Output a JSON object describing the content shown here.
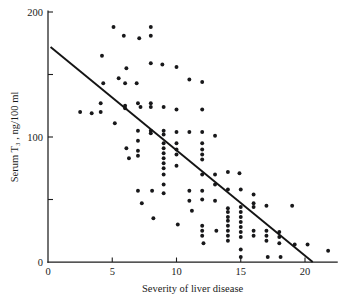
{
  "chart_data": {
    "type": "scatter",
    "title": "",
    "xlabel": "Severity of liver disease",
    "ylabel": "Serum T3 , ng/100 ml",
    "ylabel_display": "Serum T₃ , ng/100 ml",
    "xlim": [
      0,
      22.5
    ],
    "ylim": [
      0,
      205
    ],
    "xticks": [
      0,
      5,
      10,
      15,
      20
    ],
    "xtick_labels": [
      "0",
      "5",
      "10",
      "15",
      "20"
    ],
    "yticks": [
      0,
      50,
      100,
      150,
      200
    ],
    "ytick_labels": [
      "0",
      "",
      "100",
      "",
      "200"
    ],
    "ytick_labeled": [
      0,
      100,
      200
    ],
    "grid": false,
    "legend": null,
    "marker": "filled-circle",
    "marker_color": "#18181a",
    "line_color": "#141414",
    "fit_line": {
      "type": "linear-regression",
      "x_start": 0.2,
      "y_start": 172,
      "x_end": 20.6,
      "y_end": 0,
      "slope": -8.43,
      "intercept": 173.7
    },
    "points": [
      [
        2.5,
        120
      ],
      [
        3.4,
        119
      ],
      [
        4.1,
        127
      ],
      [
        4.1,
        120
      ],
      [
        4.2,
        165
      ],
      [
        4.3,
        143
      ],
      [
        5.1,
        188
      ],
      [
        5.2,
        111
      ],
      [
        5.5,
        147
      ],
      [
        5.9,
        181
      ],
      [
        6.0,
        143
      ],
      [
        6.0,
        125
      ],
      [
        6.0,
        123
      ],
      [
        6.1,
        155
      ],
      [
        6.1,
        91
      ],
      [
        6.3,
        83
      ],
      [
        6.9,
        143
      ],
      [
        7.0,
        127
      ],
      [
        7.0,
        105
      ],
      [
        7.0,
        97
      ],
      [
        7.0,
        89
      ],
      [
        7.0,
        85
      ],
      [
        7.0,
        57
      ],
      [
        7.1,
        179
      ],
      [
        7.2,
        124
      ],
      [
        7.3,
        47
      ],
      [
        8.0,
        188
      ],
      [
        8.0,
        181
      ],
      [
        8.0,
        159
      ],
      [
        8.0,
        127
      ],
      [
        8.0,
        124
      ],
      [
        8.0,
        105
      ],
      [
        8.0,
        103
      ],
      [
        8.1,
        57
      ],
      [
        8.2,
        35
      ],
      [
        8.9,
        158
      ],
      [
        9.0,
        124
      ],
      [
        9.0,
        105
      ],
      [
        9.0,
        102
      ],
      [
        9.0,
        95
      ],
      [
        9.0,
        91
      ],
      [
        9.0,
        87
      ],
      [
        9.0,
        83
      ],
      [
        9.0,
        79
      ],
      [
        9.0,
        75
      ],
      [
        9.0,
        70
      ],
      [
        9.0,
        62
      ],
      [
        9.0,
        55
      ],
      [
        10.0,
        156
      ],
      [
        10.0,
        122
      ],
      [
        10.0,
        104
      ],
      [
        10.0,
        95
      ],
      [
        10.0,
        90
      ],
      [
        10.0,
        86
      ],
      [
        10.0,
        77
      ],
      [
        10.1,
        30
      ],
      [
        11.0,
        146
      ],
      [
        11.0,
        104
      ],
      [
        11.0,
        57
      ],
      [
        11.0,
        49
      ],
      [
        11.2,
        41
      ],
      [
        12.0,
        144
      ],
      [
        12.0,
        122
      ],
      [
        12.0,
        104
      ],
      [
        12.0,
        95
      ],
      [
        12.0,
        90
      ],
      [
        12.0,
        86
      ],
      [
        12.0,
        82
      ],
      [
        12.0,
        70
      ],
      [
        12.0,
        57
      ],
      [
        12.0,
        50
      ],
      [
        12.0,
        29
      ],
      [
        12.0,
        25
      ],
      [
        12.0,
        21
      ],
      [
        12.1,
        15
      ],
      [
        13.0,
        101
      ],
      [
        13.0,
        70
      ],
      [
        13.0,
        62
      ],
      [
        13.0,
        49
      ],
      [
        13.1,
        25
      ],
      [
        14.0,
        72
      ],
      [
        14.0,
        58
      ],
      [
        14.0,
        43
      ],
      [
        14.0,
        40
      ],
      [
        14.0,
        36
      ],
      [
        14.0,
        33
      ],
      [
        14.0,
        29
      ],
      [
        14.0,
        25
      ],
      [
        14.0,
        21
      ],
      [
        14.0,
        17
      ],
      [
        14.9,
        71
      ],
      [
        15.0,
        58
      ],
      [
        15.0,
        44
      ],
      [
        15.0,
        40
      ],
      [
        15.0,
        36
      ],
      [
        15.0,
        32
      ],
      [
        15.0,
        28
      ],
      [
        15.0,
        24
      ],
      [
        15.0,
        20
      ],
      [
        15.0,
        10
      ],
      [
        15.0,
        4
      ],
      [
        16.0,
        54
      ],
      [
        16.0,
        47
      ],
      [
        16.0,
        44
      ],
      [
        16.0,
        25
      ],
      [
        16.0,
        21
      ],
      [
        17.0,
        45
      ],
      [
        17.0,
        25
      ],
      [
        17.0,
        21
      ],
      [
        17.0,
        17
      ],
      [
        17.1,
        4
      ],
      [
        18.0,
        24
      ],
      [
        18.0,
        20
      ],
      [
        18.0,
        15
      ],
      [
        18.1,
        4
      ],
      [
        19.0,
        45
      ],
      [
        19.2,
        14
      ],
      [
        20.2,
        14
      ],
      [
        21.8,
        9
      ]
    ]
  }
}
